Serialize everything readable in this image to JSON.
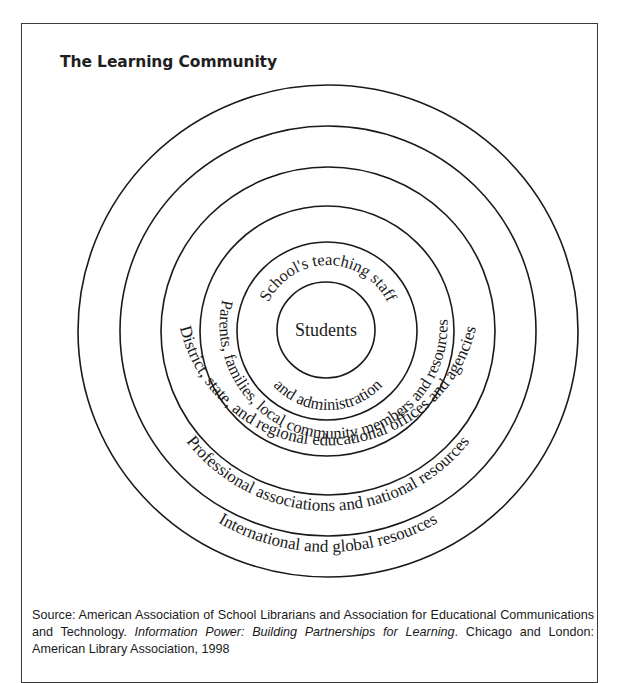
{
  "figure": {
    "title": "The Learning Community",
    "center_label": "Students",
    "rings": [
      {
        "id": "ring-1",
        "label_top": "School's teaching staff",
        "label_bottom": "and administration"
      },
      {
        "id": "ring-2",
        "label": "Parents, families, local community members and resources"
      },
      {
        "id": "ring-3",
        "label": "District, state, and regional educational offices and agencies"
      },
      {
        "id": "ring-4",
        "label": "Professional associations and national resources"
      },
      {
        "id": "ring-5",
        "label": "International and global resources"
      }
    ],
    "colors": {
      "stroke": "#1a1a1a",
      "background": "#ffffff",
      "text": "#1a1a1a"
    }
  },
  "source": {
    "prefix": "Source: American Association of School Librarians and Association for Educational Communications and Technology. ",
    "italic_title": "Information Power: Building Partnerships for Learning",
    "suffix": ". Chicago and London: American Library Association, 1998"
  }
}
